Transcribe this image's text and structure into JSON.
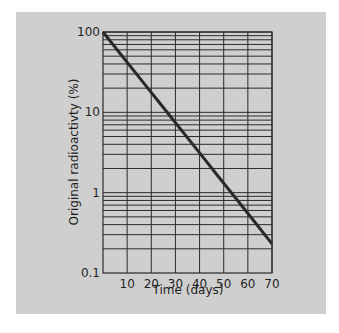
{
  "chart_data": {
    "type": "line",
    "title": "",
    "xlabel": "Time (days)",
    "ylabel": "Original radioactivty (%)",
    "yscale": "log",
    "xlim": [
      0,
      70
    ],
    "ylim": [
      0.1,
      100
    ],
    "x_ticks": [
      10,
      20,
      30,
      40,
      50,
      60,
      70
    ],
    "y_ticks": [
      0.1,
      1,
      10,
      100
    ],
    "y_tick_labels": [
      "0.1",
      "1",
      "10",
      "100"
    ],
    "grid": true,
    "legend": null,
    "series": [
      {
        "name": "Radioactive decay",
        "x": [
          0,
          8,
          16,
          24,
          32,
          40,
          48,
          56,
          64,
          70
        ],
        "y": [
          100,
          50,
          25,
          12.5,
          6.25,
          3.13,
          1.56,
          0.78,
          0.39,
          0.23
        ]
      }
    ]
  },
  "labels": {
    "x_axis": "Time (days)",
    "y_axis": "Original radioactivty (%)",
    "x_ticks": [
      "10",
      "20",
      "30",
      "40",
      "50",
      "60",
      "70"
    ],
    "y_ticks": [
      "0.1",
      "1",
      "10",
      "100"
    ]
  },
  "colors": {
    "background": "#cfcfcf",
    "grid": "#2b2b2b",
    "line": "#2a2a2a"
  }
}
